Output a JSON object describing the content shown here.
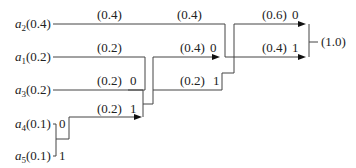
{
  "sources": [
    {
      "symbol": "a",
      "sub": "2",
      "prob": "(0.4)"
    },
    {
      "symbol": "a",
      "sub": "1",
      "prob": "(0.2)"
    },
    {
      "symbol": "a",
      "sub": "3",
      "prob": "(0.2)"
    },
    {
      "symbol": "a",
      "sub": "4",
      "prob": "(0.1)"
    },
    {
      "symbol": "a",
      "sub": "5",
      "prob": "(0.1)"
    }
  ],
  "edges": {
    "a2_top": "(0.4)",
    "a2_stage2": "(0.4)",
    "a1_top": "(0.2)",
    "a3_top": "(0.2)",
    "a3_bit": "0",
    "a45_merge": "(0.2)",
    "a45_bit": "1",
    "a4_bit": "0",
    "a5_bit": "1",
    "s2_upper": "(0.4)",
    "s2_upper_bit": "0",
    "s2_lower": "(0.2)",
    "s2_lower_bit": "1",
    "s3_upper": "(0.6)",
    "s3_upper_bit": "0",
    "s3_lower": "(0.4)",
    "s3_lower_bit": "1",
    "root": "(1.0)"
  }
}
